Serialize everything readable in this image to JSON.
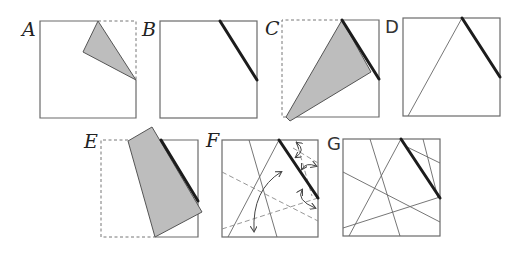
{
  "figure": {
    "panels": [
      {
        "id": "A",
        "label": "A",
        "description": "square with corner folded down to form gray triangular flap"
      },
      {
        "id": "B",
        "label": "B",
        "description": "unfolded square showing thick crease line"
      },
      {
        "id": "C",
        "label": "C",
        "description": "square with large gray flap folded toward bottom-left"
      },
      {
        "id": "D",
        "label": "D",
        "description": "unfolded square showing thick crease and thin crease"
      },
      {
        "id": "E",
        "label": "E",
        "description": "square with gray flap folded to the left along crease"
      },
      {
        "id": "F",
        "label": "F",
        "description": "crease pattern with dashed lines and double-headed arrows"
      },
      {
        "id": "G",
        "label": "G",
        "description": "crease pattern with multiple thin lines and thick crease"
      }
    ]
  },
  "colors": {
    "square_stroke": "#6a6a6a",
    "flap_fill": "#bdbdbd",
    "thick_crease": "#1c1c1c",
    "dashed": "#777777"
  }
}
